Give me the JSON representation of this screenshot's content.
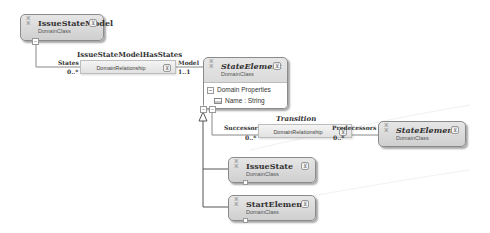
{
  "diagram": {
    "classes": [
      {
        "id": "issue-state-model",
        "name": "IssueStateModel",
        "stereotype": "DomainClass",
        "abstract": false
      },
      {
        "id": "state-element",
        "name": "StateElement",
        "stereotype": "DomainClass",
        "abstract": true,
        "compartment_title": "Domain Properties",
        "properties": [
          "Name : String"
        ]
      },
      {
        "id": "state-element-ref",
        "name": "StateElement",
        "stereotype": "DomainClass",
        "abstract": true
      },
      {
        "id": "issue-state",
        "name": "IssueState",
        "stereotype": "DomainClass",
        "abstract": false
      },
      {
        "id": "start-element",
        "name": "StartElement",
        "stereotype": "DomainClass",
        "abstract": false
      }
    ],
    "relationships": [
      {
        "id": "issue-state-model-has-states",
        "name": "IssueStateModelHasStates",
        "kind": "DomainRelationship",
        "source_role": "States",
        "source_multiplicity": "0..*",
        "target_role": "Model",
        "target_multiplicity": "1..1"
      },
      {
        "id": "transition",
        "name": "Transition",
        "kind": "DomainRelationship",
        "source_role": "Successors",
        "source_multiplicity": "0..*",
        "target_role": "Predecessors",
        "target_multiplicity": "0..*"
      }
    ],
    "glyphs": {
      "toggle": "⊻",
      "minus": "−",
      "class_icon": "⁑"
    }
  }
}
